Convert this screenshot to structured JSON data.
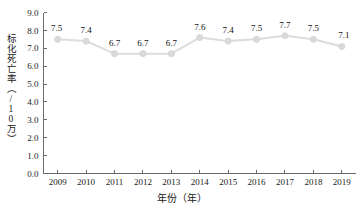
{
  "chart_data": {
    "type": "line",
    "title": "",
    "xlabel": "年份（年）",
    "ylabel": "标化死亡率（/10万）",
    "categories": [
      "2009",
      "2010",
      "2011",
      "2012",
      "2013",
      "2014",
      "2015",
      "2016",
      "2017",
      "2018",
      "2019"
    ],
    "values": [
      7.5,
      7.4,
      6.7,
      6.7,
      6.7,
      7.6,
      7.4,
      7.5,
      7.7,
      7.5,
      7.1
    ],
    "point_labels": [
      "7.5",
      "7.4",
      "6.7",
      "6.7",
      "6.7",
      "7.6",
      "7.4",
      "7.5",
      "7.7",
      "7.5",
      "7.1"
    ],
    "ylim": [
      0.0,
      9.0
    ],
    "ytick_values": [
      0.0,
      1.0,
      2.0,
      3.0,
      4.0,
      5.0,
      6.0,
      7.0,
      8.0,
      9.0
    ],
    "ytick_labels": [
      "0.0",
      "1.0",
      "2.0",
      "3.0",
      "4.0",
      "5.0",
      "6.0",
      "7.0",
      "8.0",
      "9.0"
    ],
    "grid": false,
    "legend": false,
    "legend_position": "none",
    "series_color": "#dcdcdc",
    "marker_color": "#dadada",
    "axis_color": "#6b6b6b",
    "text_color": "#1a1a1a"
  }
}
